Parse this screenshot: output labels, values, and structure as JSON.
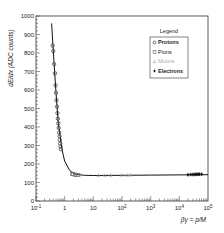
{
  "chart_data": {
    "type": "scatter",
    "title": "",
    "xlabel": "βγ = p/M",
    "ylabel": "dE/dx (ADC counts)",
    "xscale": "log",
    "xlim": [
      0.1,
      100000
    ],
    "ylim": [
      0,
      1000
    ],
    "x_ticks": [
      "10^-1",
      "1",
      "10",
      "10^2",
      "10^3",
      "10^4",
      "10^5"
    ],
    "y_ticks": [
      0,
      100,
      200,
      300,
      400,
      500,
      600,
      700,
      800,
      900,
      1000
    ],
    "legend": {
      "title": "Legend",
      "position": "upper right",
      "entries": [
        {
          "label": "Protons",
          "marker": "circle",
          "color": "#333333"
        },
        {
          "label": "Pions",
          "marker": "square",
          "color": "#666666"
        },
        {
          "label": "Muons",
          "marker": "triangle",
          "color": "#aaaaaa"
        },
        {
          "label": "Electrons",
          "marker": "diamond",
          "color": "#111111"
        }
      ]
    },
    "series": [
      {
        "name": "Protons",
        "x": [
          0.38,
          0.4,
          0.43,
          0.46,
          0.48,
          0.5,
          0.52,
          0.54,
          0.56,
          0.58,
          0.6,
          0.62,
          0.64,
          0.66,
          0.68,
          0.7,
          0.72,
          0.74
        ],
        "y": [
          840,
          810,
          740,
          690,
          625,
          585,
          545,
          510,
          475,
          445,
          420,
          395,
          370,
          350,
          330,
          310,
          295,
          280
        ]
      },
      {
        "name": "Pions",
        "x": [
          1.8,
          2.0,
          2.3,
          2.6,
          3.0
        ],
        "y": [
          148,
          145,
          142,
          141,
          140
        ]
      },
      {
        "name": "Muons",
        "x": [
          15,
          25,
          40,
          100,
          150,
          200
        ],
        "y": [
          138,
          138,
          139,
          140,
          140,
          141
        ]
      },
      {
        "name": "Electrons",
        "x": [
          20000,
          25000,
          30000,
          35000,
          40000,
          45000,
          50000,
          60000
        ],
        "y": [
          142,
          143,
          143,
          144,
          144,
          145,
          145,
          145
        ]
      },
      {
        "name": "Fit",
        "x": [
          0.35,
          0.4,
          0.5,
          0.6,
          0.8,
          1.0,
          1.5,
          2,
          3,
          5,
          10,
          100,
          1000,
          10000,
          100000
        ],
        "y": [
          960,
          810,
          585,
          420,
          280,
          215,
          165,
          150,
          142,
          139,
          138,
          139,
          140,
          141,
          142
        ]
      }
    ],
    "grid": false
  }
}
